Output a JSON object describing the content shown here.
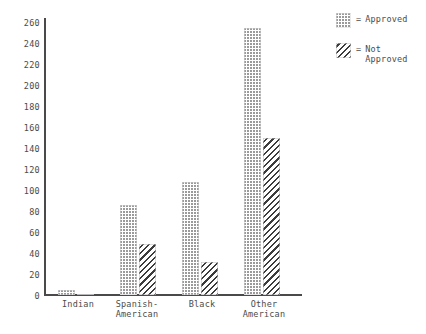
{
  "chart_data": {
    "type": "bar",
    "title": "",
    "subtitle": "",
    "xlabel": "",
    "ylabel": "",
    "categories": [
      "Indian",
      "Spanish-\nAmerican",
      "Black",
      "Other\nAmerican"
    ],
    "series": [
      {
        "name": "Approved",
        "values": [
          5,
          88,
          110,
          260
        ]
      },
      {
        "name": "Not\nApproved",
        "values": [
          1,
          50,
          32,
          153
        ]
      }
    ],
    "ylim": [
      0,
      270
    ],
    "yticks": [
      0,
      20,
      40,
      60,
      80,
      100,
      120,
      140,
      160,
      180,
      200,
      220,
      240,
      260
    ],
    "ytick_labels": [
      "0",
      "20",
      "40",
      "60",
      "80",
      "100",
      "120",
      "140",
      "160",
      "180",
      "200",
      "220",
      "240",
      "260"
    ],
    "grid": false,
    "legend_position": "right",
    "legend_separator": "=",
    "colors": {
      "approved_fill": "#9a9a9a",
      "not_approved_fill": "#3c3c3c",
      "axis": "#4a4a4a",
      "text": "#4b4b4b",
      "background": "#ffffff"
    }
  },
  "legend": {
    "entries": [
      {
        "pattern": "dotted",
        "separator": "=",
        "label": "Approved"
      },
      {
        "pattern": "diagonal-hatch",
        "separator": "=",
        "label": "Not\nApproved"
      }
    ]
  }
}
